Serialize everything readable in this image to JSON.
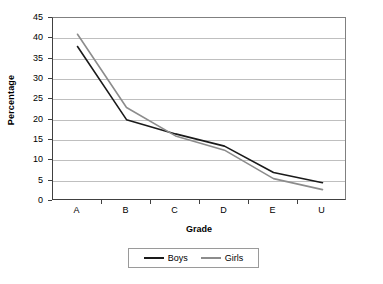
{
  "chart_data": {
    "type": "line",
    "title": "",
    "subtitle": "",
    "xlabel": "Grade",
    "ylabel": "Percentage",
    "categories": [
      "A",
      "B",
      "C",
      "D",
      "E",
      "U"
    ],
    "ylim": [
      0,
      45
    ],
    "yticks": [
      0,
      5,
      10,
      15,
      20,
      25,
      30,
      35,
      40,
      45
    ],
    "grid": true,
    "legend_position": "bottom",
    "series": [
      {
        "name": "Boys",
        "color": "#1a1a1a",
        "values": [
          38,
          20,
          16.5,
          13.5,
          7,
          4.5
        ]
      },
      {
        "name": "Girls",
        "color": "#8c8c8c",
        "values": [
          41,
          23,
          16,
          12.5,
          5.5,
          2.8
        ]
      }
    ]
  },
  "axis": {
    "y_title": "Percentage",
    "x_title": "Grade"
  },
  "colors": {
    "boys_line": "#1a1a1a",
    "girls_line": "#8c8c8c",
    "gridline": "#bfbfbf",
    "axis": "#404040",
    "frame": "#808080",
    "background": "#ffffff"
  }
}
